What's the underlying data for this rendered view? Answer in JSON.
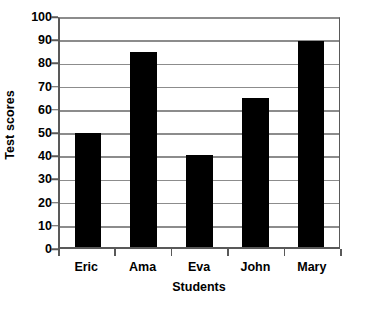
{
  "chart_data": {
    "type": "bar",
    "title": "",
    "subtitle": "",
    "categories": [
      "Eric",
      "Ama",
      "Eva",
      "John",
      "Mary"
    ],
    "values": [
      50,
      85,
      40,
      65,
      90
    ],
    "xlabel": "Students",
    "ylabel": "Test scores",
    "ylim": [
      0,
      100
    ],
    "ytick_step": 10,
    "yticks": [
      0,
      10,
      20,
      30,
      40,
      50,
      60,
      70,
      80,
      90,
      100
    ],
    "ytick_labels": [
      "0",
      "10",
      "20",
      "30",
      "40",
      "50",
      "60",
      "70",
      "80",
      "90",
      "100"
    ],
    "grid": true,
    "grid_axis": "y",
    "legend": false,
    "legend_position": "none",
    "bar_color": "#000000",
    "grid_color": "#8c8c8c",
    "axis_color": "#595959",
    "background_color": "#ffffff",
    "series": [
      {
        "name": "Test scores",
        "values": [
          50,
          85,
          40,
          65,
          90
        ]
      }
    ],
    "annotations": []
  }
}
